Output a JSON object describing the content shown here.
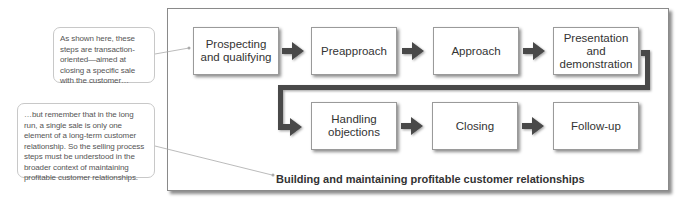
{
  "diagram": {
    "steps": [
      {
        "label": "Prospecting and qualifying"
      },
      {
        "label": "Preapproach"
      },
      {
        "label": "Approach"
      },
      {
        "label": "Presentation and demonstration"
      },
      {
        "label": "Handling objections"
      },
      {
        "label": "Closing"
      },
      {
        "label": "Follow-up"
      }
    ],
    "caption": "Building and maintaining profitable customer relationships",
    "notes": [
      {
        "text": "As shown here, these steps are transaction-oriented—aimed at closing a specific sale with the customer…"
      },
      {
        "text": "…but remember that in the long run, a single sale is only one element of a long-term customer relationship. So the selling process steps must be understood in the broader context of maintaining profitable customer relationships."
      }
    ],
    "colors": {
      "arrow": "#4a4a4a",
      "box_border": "#9a9a9a",
      "frame_border": "#8a8a8a",
      "note_border": "#c8c8c8",
      "leader_line": "#aaaaaa"
    },
    "icons": {
      "step_arrow": "right-arrow-icon",
      "connector": "elbow-connector-icon"
    }
  }
}
